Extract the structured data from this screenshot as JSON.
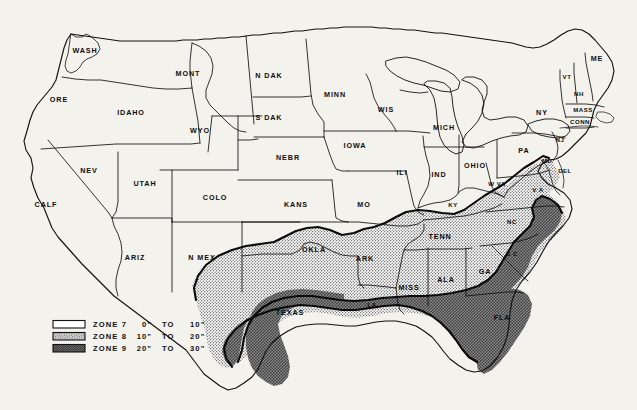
{
  "figure": {
    "kind": "thematic-map",
    "region": "Contiguous United States",
    "background_color": "#f4f2ed",
    "line_color": "#111111"
  },
  "zones": {
    "zone7": {
      "name": "ZONE 7",
      "range": "0\" TO 10\"",
      "low": "0\"",
      "to": "TO",
      "high": "10\"",
      "fill": "#ffffff",
      "pattern": "plain"
    },
    "zone8": {
      "name": "ZONE 8",
      "range": "10\" TO 20\"",
      "low": "10\"",
      "to": "TO",
      "high": "20\"",
      "fill": "#c9c9c9",
      "pattern": "fine-dot"
    },
    "zone9": {
      "name": "ZONE 9",
      "range": "20\" TO 30\"",
      "low": "20\"",
      "to": "TO",
      "high": "30\"",
      "fill": "#9a9a9a",
      "pattern": "coarse-dot"
    }
  },
  "legend": {
    "entries": [
      {
        "swatch": "zone7",
        "name": "ZONE 7",
        "low": "0\"",
        "to": "TO",
        "high": "10\""
      },
      {
        "swatch": "zone8",
        "name": "ZONE 8",
        "low": "10\"",
        "to": "TO",
        "high": "20\""
      },
      {
        "swatch": "zone9",
        "name": "ZONE 9",
        "low": "20\"",
        "to": "TO",
        "high": "30\""
      }
    ]
  },
  "states": [
    {
      "id": "wash",
      "label": "WASH",
      "x": 85,
      "y": 51,
      "zone": "zone7"
    },
    {
      "id": "ore",
      "label": "ORE",
      "x": 59,
      "y": 100,
      "zone": "zone7"
    },
    {
      "id": "idaho",
      "label": "IDAHO",
      "x": 131,
      "y": 113,
      "zone": "zone7"
    },
    {
      "id": "mont",
      "label": "MONT",
      "x": 188,
      "y": 74,
      "zone": "zone7"
    },
    {
      "id": "wyo",
      "label": "WYO",
      "x": 200,
      "y": 131,
      "zone": "zone7"
    },
    {
      "id": "ndak",
      "label": "N DAK",
      "x": 269,
      "y": 76,
      "zone": "zone7"
    },
    {
      "id": "sdak",
      "label": "S DAK",
      "x": 269,
      "y": 118,
      "zone": "zone7"
    },
    {
      "id": "minn",
      "label": "MINN",
      "x": 335,
      "y": 95,
      "zone": "zone7"
    },
    {
      "id": "wis",
      "label": "WIS",
      "x": 386,
      "y": 110,
      "zone": "zone7"
    },
    {
      "id": "mich",
      "label": "MICH",
      "x": 444,
      "y": 128,
      "zone": "zone7"
    },
    {
      "id": "ny",
      "label": "NY",
      "x": 542,
      "y": 113,
      "zone": "zone7"
    },
    {
      "id": "me",
      "label": "ME",
      "x": 597,
      "y": 59,
      "zone": "zone7"
    },
    {
      "id": "vt",
      "label": "VT",
      "x": 567,
      "y": 77,
      "zone": "zone7"
    },
    {
      "id": "nh",
      "label": "NH",
      "x": 579,
      "y": 94,
      "zone": "zone7"
    },
    {
      "id": "mass",
      "label": "MASS",
      "x": 583,
      "y": 110,
      "zone": "zone7"
    },
    {
      "id": "conn",
      "label": "CONN",
      "x": 580,
      "y": 122,
      "zone": "zone7"
    },
    {
      "id": "pa",
      "label": "PA",
      "x": 524,
      "y": 151,
      "zone": "zone7"
    },
    {
      "id": "nebr",
      "label": "NEBR",
      "x": 288,
      "y": 158,
      "zone": "zone7"
    },
    {
      "id": "iowa",
      "label": "IOWA",
      "x": 355,
      "y": 146,
      "zone": "zone7"
    },
    {
      "id": "ili",
      "label": "ILI",
      "x": 402,
      "y": 173,
      "zone": "zone7"
    },
    {
      "id": "ind",
      "label": "IND",
      "x": 439,
      "y": 175,
      "zone": "zone7"
    },
    {
      "id": "ohio",
      "label": "OHIO",
      "x": 475,
      "y": 166,
      "zone": "zone7"
    },
    {
      "id": "wva",
      "label": "W VA",
      "x": 497,
      "y": 184,
      "zone": "zone7"
    },
    {
      "id": "va",
      "label": "V A",
      "x": 538,
      "y": 190,
      "zone": "zone8"
    },
    {
      "id": "md",
      "label": "MD",
      "x": 547,
      "y": 161,
      "zone": "zone8"
    },
    {
      "id": "del",
      "label": "DEL",
      "x": 565,
      "y": 171,
      "zone": "zone8"
    },
    {
      "id": "nj",
      "label": "NJ",
      "x": 560,
      "y": 140,
      "zone": "zone7"
    },
    {
      "id": "nev",
      "label": "NEV",
      "x": 89,
      "y": 171,
      "zone": "zone7"
    },
    {
      "id": "utah",
      "label": "UTAH",
      "x": 145,
      "y": 184,
      "zone": "zone7"
    },
    {
      "id": "colo",
      "label": "COLO",
      "x": 215,
      "y": 198,
      "zone": "zone7"
    },
    {
      "id": "calf",
      "label": "CALF",
      "x": 46,
      "y": 205,
      "zone": "zone7"
    },
    {
      "id": "kans",
      "label": "KANS",
      "x": 296,
      "y": 205,
      "zone": "zone7"
    },
    {
      "id": "mo",
      "label": "MO",
      "x": 364,
      "y": 205,
      "zone": "zone7"
    },
    {
      "id": "ky",
      "label": "KY",
      "x": 453,
      "y": 205,
      "zone": "zone7"
    },
    {
      "id": "nc",
      "label": "NC",
      "x": 512,
      "y": 222,
      "zone": "zone8"
    },
    {
      "id": "ariz",
      "label": "ARIZ",
      "x": 135,
      "y": 258,
      "zone": "zone7"
    },
    {
      "id": "nmex",
      "label": "N MEX",
      "x": 202,
      "y": 258,
      "zone": "zone7"
    },
    {
      "id": "okla",
      "label": "OKLA",
      "x": 314,
      "y": 250,
      "zone": "zone8"
    },
    {
      "id": "ark",
      "label": "ARK",
      "x": 365,
      "y": 259,
      "zone": "zone8"
    },
    {
      "id": "tenn",
      "label": "TENN",
      "x": 440,
      "y": 237,
      "zone": "zone8"
    },
    {
      "id": "sc",
      "label": "S C",
      "x": 512,
      "y": 254,
      "zone": "zone8"
    },
    {
      "id": "ga",
      "label": "GA",
      "x": 485,
      "y": 272,
      "zone": "zone8"
    },
    {
      "id": "ala",
      "label": "ALA",
      "x": 446,
      "y": 280,
      "zone": "zone8"
    },
    {
      "id": "miss",
      "label": "MISS",
      "x": 409,
      "y": 288,
      "zone": "zone8"
    },
    {
      "id": "la",
      "label": "LA",
      "x": 372,
      "y": 305,
      "zone": "zone8"
    },
    {
      "id": "texas",
      "label": "TEXAS",
      "x": 290,
      "y": 313,
      "zone": "zone8"
    },
    {
      "id": "fla",
      "label": "FLA",
      "x": 502,
      "y": 318,
      "zone": "zone9"
    }
  ]
}
